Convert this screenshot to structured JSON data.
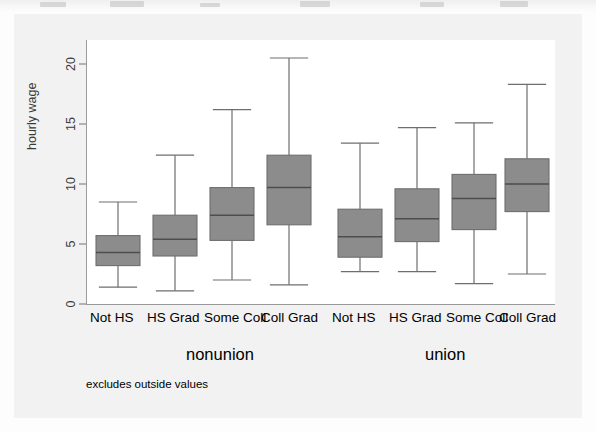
{
  "figure": {
    "note": "excludes outside values",
    "group_labels": [
      "nonunion",
      "union"
    ],
    "box_fill_color": "#8c8c8c",
    "box_edge_color": "#6e6e6e",
    "plot_background": "#ffffff",
    "plate_background": "#f2f2f2"
  },
  "chart_data": {
    "type": "box",
    "title": "",
    "xlabel": "",
    "ylabel": "hourly wage",
    "ylim": [
      0,
      22
    ],
    "yticks": [
      0,
      5,
      10,
      15,
      20
    ],
    "ytick_labels": [
      "0",
      "5",
      "10",
      "15",
      "20"
    ],
    "grid": false,
    "legend": "none",
    "categories": [
      "Not HS",
      "HS Grad",
      "Some Coll",
      "Coll Grad"
    ],
    "groups": [
      "nonunion",
      "union"
    ],
    "annotation": "excludes outside values",
    "boxes": [
      {
        "group": "nonunion",
        "category": "Not HS",
        "whisker_low": 1.4,
        "q1": 3.2,
        "median": 4.3,
        "q3": 5.7,
        "whisker_high": 8.5
      },
      {
        "group": "nonunion",
        "category": "HS Grad",
        "whisker_low": 1.1,
        "q1": 4.0,
        "median": 5.4,
        "q3": 7.4,
        "whisker_high": 12.4
      },
      {
        "group": "nonunion",
        "category": "Some Coll",
        "whisker_low": 2.0,
        "q1": 5.3,
        "median": 7.4,
        "q3": 9.7,
        "whisker_high": 16.2
      },
      {
        "group": "nonunion",
        "category": "Coll Grad",
        "whisker_low": 1.6,
        "q1": 6.6,
        "median": 9.7,
        "q3": 12.4,
        "whisker_high": 20.5
      },
      {
        "group": "union",
        "category": "Not HS",
        "whisker_low": 2.7,
        "q1": 3.9,
        "median": 5.6,
        "q3": 7.9,
        "whisker_high": 13.4
      },
      {
        "group": "union",
        "category": "HS Grad",
        "whisker_low": 2.7,
        "q1": 5.2,
        "median": 7.1,
        "q3": 9.6,
        "whisker_high": 14.7
      },
      {
        "group": "union",
        "category": "Some Coll",
        "whisker_low": 1.7,
        "q1": 6.2,
        "median": 8.8,
        "q3": 10.8,
        "whisker_high": 15.1
      },
      {
        "group": "union",
        "category": "Coll Grad",
        "whisker_low": 2.5,
        "q1": 7.7,
        "median": 10.0,
        "q3": 12.1,
        "whisker_high": 18.3
      }
    ]
  },
  "axis": {
    "y_title": "hourly wage"
  },
  "category_labels_row": [
    "Not HS",
    "HS Grad",
    "Some Coll",
    "Coll Grad",
    "Not HS",
    "HS Grad",
    "Some Coll",
    "Coll Grad"
  ]
}
